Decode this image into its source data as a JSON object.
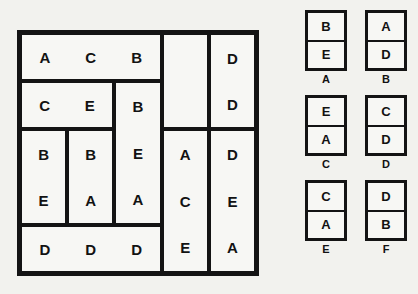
{
  "puzzle": {
    "grid": {
      "columns": 5,
      "rows": 5,
      "pieces": [
        {
          "id": "piece-top-wide",
          "letters": [
            "A",
            "C",
            "B"
          ],
          "orientation": "horizontal",
          "col": 0,
          "row": 0,
          "colspan": 3,
          "rowspan": 1
        },
        {
          "id": "piece-empty",
          "letters": [
            "",
            ""
          ],
          "orientation": "vertical",
          "col": 3,
          "row": 0,
          "colspan": 1,
          "rowspan": 2,
          "empty": true
        },
        {
          "id": "piece-top-right-dd",
          "letters": [
            "D",
            "D"
          ],
          "orientation": "vertical",
          "col": 4,
          "row": 0,
          "colspan": 1,
          "rowspan": 2
        },
        {
          "id": "piece-ce",
          "letters": [
            "C",
            "E"
          ],
          "orientation": "horizontal",
          "col": 0,
          "row": 1,
          "colspan": 2,
          "rowspan": 1
        },
        {
          "id": "piece-bea",
          "letters": [
            "B",
            "E",
            "A"
          ],
          "orientation": "vertical",
          "col": 2,
          "row": 1,
          "colspan": 1,
          "rowspan": 3
        },
        {
          "id": "piece-be",
          "letters": [
            "B",
            "E"
          ],
          "orientation": "vertical",
          "col": 0,
          "row": 2,
          "colspan": 1,
          "rowspan": 2
        },
        {
          "id": "piece-ba",
          "letters": [
            "B",
            "A"
          ],
          "orientation": "vertical",
          "col": 1,
          "row": 2,
          "colspan": 1,
          "rowspan": 2
        },
        {
          "id": "piece-ace",
          "letters": [
            "A",
            "C",
            "E"
          ],
          "orientation": "vertical",
          "col": 3,
          "row": 2,
          "colspan": 1,
          "rowspan": 3
        },
        {
          "id": "piece-dea",
          "letters": [
            "D",
            "E",
            "A"
          ],
          "orientation": "vertical",
          "col": 4,
          "row": 2,
          "colspan": 1,
          "rowspan": 3
        },
        {
          "id": "piece-bottom-wide",
          "letters": [
            "D",
            "D",
            "D"
          ],
          "orientation": "horizontal",
          "col": 0,
          "row": 4,
          "colspan": 3,
          "rowspan": 1
        }
      ]
    },
    "options": [
      {
        "label": "A",
        "letters": [
          "B",
          "E"
        ]
      },
      {
        "label": "B",
        "letters": [
          "A",
          "D"
        ]
      },
      {
        "label": "C",
        "letters": [
          "E",
          "A"
        ]
      },
      {
        "label": "D",
        "letters": [
          "C",
          "D"
        ]
      },
      {
        "label": "E",
        "letters": [
          "C",
          "A"
        ]
      },
      {
        "label": "F",
        "letters": [
          "D",
          "B"
        ]
      }
    ],
    "colors": {
      "page_background": "#f2f2ee",
      "cell_background": "#f7f7f4",
      "border": "#141414",
      "text": "#121212"
    }
  }
}
